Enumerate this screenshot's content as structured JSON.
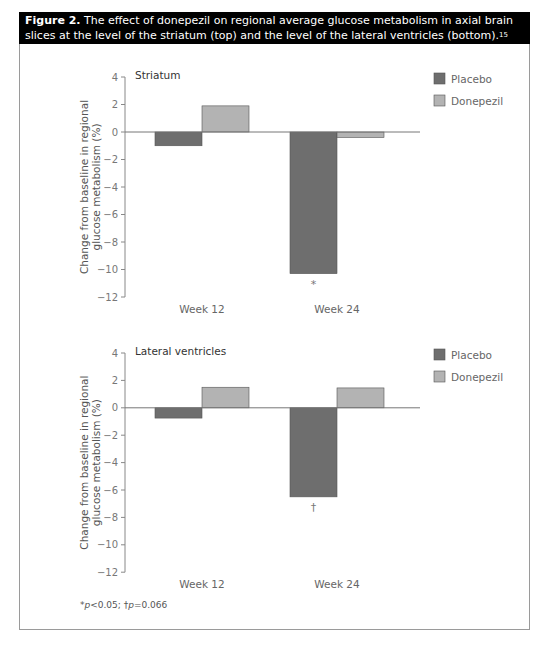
{
  "caption": {
    "label": "Figure 2.",
    "text": " The effect of donepezil on regional average glucose metabolism in axial brain slices at the level of the striatum (top) and the level of the lateral ventricles (bottom).",
    "ref": "15"
  },
  "colors": {
    "placebo": "#6e6e6e",
    "donepezil": "#b3b3b3",
    "axis": "#888888",
    "text": "#666666"
  },
  "footnote": {
    "star": "*",
    "p1": "p",
    "v1": "<0.05; ",
    "dagger": "†",
    "p2": "p",
    "v2": "=0.066"
  },
  "chart_data": [
    {
      "type": "bar",
      "title": "Striatum",
      "categories": [
        "Week 12",
        "Week 24"
      ],
      "series": [
        {
          "name": "Placebo",
          "values": [
            -1.0,
            -10.3
          ]
        },
        {
          "name": "Donepezil",
          "values": [
            1.9,
            -0.4
          ]
        }
      ],
      "annotations": [
        {
          "category": "Week 24",
          "series": "Placebo",
          "text": "*"
        }
      ],
      "xlabel": "",
      "ylabel": "Change from baseline in regional glucose metabolism (%)",
      "ylim": [
        -12,
        4
      ],
      "yticks": [
        4,
        2,
        0,
        -2,
        -4,
        -6,
        -8,
        -10,
        -12
      ],
      "grid": false,
      "legend": {
        "position": "top-right",
        "entries": [
          "Placebo",
          "Donepezil"
        ]
      }
    },
    {
      "type": "bar",
      "title": "Lateral ventricles",
      "categories": [
        "Week 12",
        "Week 24"
      ],
      "series": [
        {
          "name": "Placebo",
          "values": [
            -0.75,
            -6.5
          ]
        },
        {
          "name": "Donepezil",
          "values": [
            1.5,
            1.45
          ]
        }
      ],
      "annotations": [
        {
          "category": "Week 24",
          "series": "Placebo",
          "text": "†"
        }
      ],
      "xlabel": "",
      "ylabel": "Change from baseline in regional glucose metabolism (%)",
      "ylim": [
        -12,
        4
      ],
      "yticks": [
        4,
        2,
        0,
        -2,
        -4,
        -6,
        -8,
        -10,
        -12
      ],
      "grid": false,
      "legend": {
        "position": "top-right",
        "entries": [
          "Placebo",
          "Donepezil"
        ]
      }
    }
  ]
}
